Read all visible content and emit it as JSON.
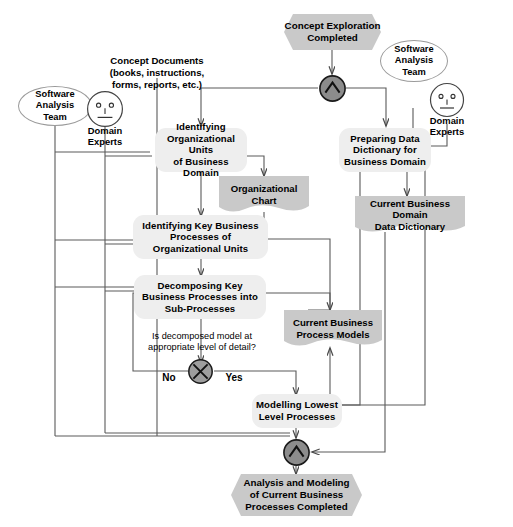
{
  "diagram": {
    "title": "Analysis and Modeling of Current Business Processes",
    "type": "UML activity diagram",
    "colors": {
      "activity_fill": "#eeeeee",
      "artifact_fill": "#c9c9c9",
      "event_fill": "#c9c9c9",
      "sync_fill": "#8c8c8c",
      "decision_fill": "#9e9e9e",
      "line": "#555555",
      "text": "#000000"
    }
  },
  "events": {
    "start": "Concept Exploration\nCompleted",
    "start_line1": "Concept Exploration",
    "start_line2": "Completed",
    "end_line1": "Analysis and Modeling",
    "end_line2": "of Current Business",
    "end_line3": "Processes Completed"
  },
  "actors": [
    {
      "id": "sat-left",
      "label_line1": "Software",
      "label_line2": "Analysis",
      "label_line3": "Team",
      "kind": "ellipse"
    },
    {
      "id": "de-left",
      "label_line1": "Domain",
      "label_line2": "Experts",
      "kind": "person"
    },
    {
      "id": "sat-right",
      "label_line1": "Software",
      "label_line2": "Analysis",
      "label_line3": "Team",
      "kind": "ellipse"
    },
    {
      "id": "de-right",
      "label_line1": "Domain",
      "label_line2": "Experts",
      "kind": "person"
    }
  ],
  "inputs": {
    "concept_documents_line1": "Concept Documents",
    "concept_documents_line2": "(books, instructions,",
    "concept_documents_line3": "forms, reports, etc.)"
  },
  "activities": [
    {
      "id": "a1",
      "line1": "Identifying",
      "line2": "Organizational Units",
      "line3": "of Business Domain"
    },
    {
      "id": "a2",
      "line1": "Preparing Data",
      "line2": "Dictionary for",
      "line3": "Business Domain"
    },
    {
      "id": "a3",
      "line1": "Identifying Key Business",
      "line2": "Processes of",
      "line3": "Organizational Units"
    },
    {
      "id": "a4",
      "line1": "Decomposing Key",
      "line2": "Business Processes into",
      "line3": "Sub-Processes"
    },
    {
      "id": "a5",
      "line1": "Modelling Lowest",
      "line2": "Level Processes",
      "line3": ""
    }
  ],
  "artifacts": [
    {
      "id": "d1",
      "line1": "Organizational",
      "line2": "Chart"
    },
    {
      "id": "d2",
      "line1": "Current Business Domain",
      "line2": "Data Dictionary"
    },
    {
      "id": "d3",
      "line1": "Current Business",
      "line2": "Process Models"
    }
  ],
  "decision": {
    "question_line1": "Is decomposed model at",
    "question_line2": "appropriate level of detail?",
    "branch_no": "No",
    "branch_yes": "Yes",
    "glyph": "x-decision-icon"
  },
  "sync": {
    "glyph": "and-fork-icon",
    "symbol": "∧"
  }
}
